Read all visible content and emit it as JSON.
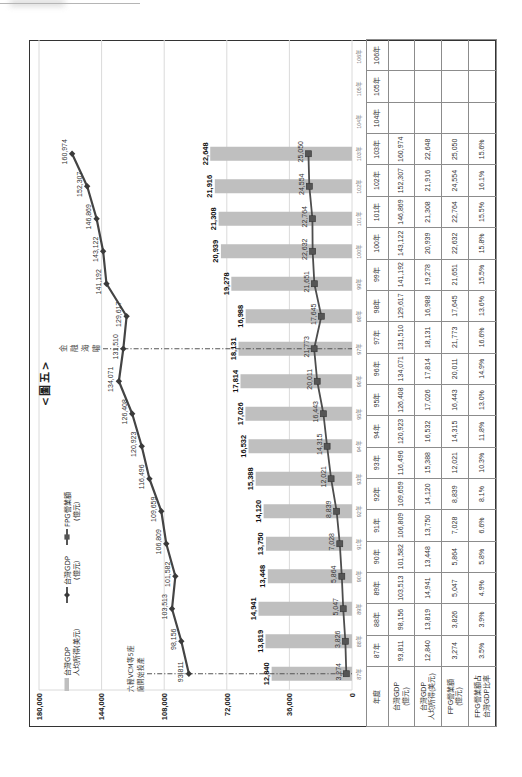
{
  "chart_data": {
    "type": "bar",
    "title": "<圖五>",
    "categories": [
      "87年",
      "88年",
      "89年",
      "90年",
      "91年",
      "92年",
      "93年",
      "94年",
      "95年",
      "96年",
      "97年",
      "98年",
      "99年",
      "100年",
      "101年",
      "102年",
      "103年",
      "104年",
      "105年",
      "106年"
    ],
    "series": [
      {
        "name": "台灣GDP 人均所得(美元)",
        "type": "bar",
        "axis": "secondary",
        "color": "#bfbfbf",
        "values": [
          12840,
          13819,
          14941,
          13448,
          13750,
          14120,
          15388,
          16532,
          17026,
          17814,
          18131,
          16988,
          19278,
          20939,
          21308,
          21916,
          22648,
          null,
          null,
          null
        ]
      },
      {
        "name": "台灣GDP (億元)",
        "type": "line",
        "marker": "diamond",
        "axis": "primary",
        "color": "#444444",
        "values": [
          93811,
          98156,
          103513,
          101582,
          106809,
          109659,
          116496,
          120923,
          126408,
          134071,
          131510,
          129617,
          141192,
          143122,
          146869,
          152307,
          160974,
          null,
          null,
          null
        ]
      },
      {
        "name": "FPG營業額 (億元)",
        "type": "line",
        "marker": "square",
        "axis": "primary",
        "color": "#4d4d4d",
        "values": [
          3274,
          3826,
          5047,
          5864,
          7028,
          8839,
          12021,
          14315,
          16443,
          20011,
          21773,
          17645,
          21651,
          22632,
          22764,
          24554,
          25050,
          null,
          null,
          null
        ]
      }
    ],
    "xlabel": "",
    "ylabel": "",
    "ylim": [
      0,
      180000
    ],
    "yticks": [
      0,
      36000,
      72000,
      108000,
      144000,
      180000
    ],
    "ytick_labels": [
      "0",
      "36,000",
      "72,000",
      "108,000",
      "144,000",
      "180,000"
    ],
    "y2lim": [
      0,
      50000
    ],
    "grid": true,
    "gridline_color": "#dadada",
    "legend_position": "top-left inside plot",
    "legend": [
      {
        "symbol": "bar",
        "lines": [
          "台灣GDP",
          "人均所得(美元)"
        ]
      },
      {
        "symbol": "line-diamond",
        "lines": [
          "台灣GDP",
          "(億元)"
        ]
      },
      {
        "symbol": "line-square",
        "lines": [
          "FPG營業額",
          "(億元)"
        ]
      }
    ],
    "annotations": [
      {
        "at": "87年",
        "lines": [
          "六輕VCM等5座",
          "廠開始投產"
        ]
      },
      {
        "at": "97年",
        "orientation": "vertical",
        "lines": [
          "金",
          "融",
          "海",
          "嘯"
        ]
      }
    ]
  },
  "table": {
    "header_label": "年度",
    "row_headers": [
      [
        "台灣GDP",
        "(億元)"
      ],
      [
        "台灣GDP",
        "人均所得(美元)"
      ],
      [
        "FPG營業額",
        "(億元)"
      ],
      [
        "FPG營業額占",
        "台灣GDP比率"
      ]
    ],
    "columns": [
      {
        "year": "87年",
        "gdp": "93,811",
        "per_capita_usd": "12,840",
        "fpg_revenue": "3,274",
        "fpg_share": "3.5%"
      },
      {
        "year": "88年",
        "gdp": "98,156",
        "per_capita_usd": "13,819",
        "fpg_revenue": "3,826",
        "fpg_share": "3.9%"
      },
      {
        "year": "89年",
        "gdp": "103,513",
        "per_capita_usd": "14,941",
        "fpg_revenue": "5,047",
        "fpg_share": "4.9%"
      },
      {
        "year": "90年",
        "gdp": "101,582",
        "per_capita_usd": "13,448",
        "fpg_revenue": "5,864",
        "fpg_share": "5.8%"
      },
      {
        "year": "91年",
        "gdp": "106,809",
        "per_capita_usd": "13,750",
        "fpg_revenue": "7,028",
        "fpg_share": "6.6%"
      },
      {
        "year": "92年",
        "gdp": "109,659",
        "per_capita_usd": "14,120",
        "fpg_revenue": "8,839",
        "fpg_share": "8.1%"
      },
      {
        "year": "93年",
        "gdp": "116,496",
        "per_capita_usd": "15,388",
        "fpg_revenue": "12,021",
        "fpg_share": "10.3%"
      },
      {
        "year": "94年",
        "gdp": "120,923",
        "per_capita_usd": "16,532",
        "fpg_revenue": "14,315",
        "fpg_share": "11.8%"
      },
      {
        "year": "95年",
        "gdp": "126,408",
        "per_capita_usd": "17,026",
        "fpg_revenue": "16,443",
        "fpg_share": "13.0%"
      },
      {
        "year": "96年",
        "gdp": "134,071",
        "per_capita_usd": "17,814",
        "fpg_revenue": "20,011",
        "fpg_share": "14.9%"
      },
      {
        "year": "97年",
        "gdp": "131,510",
        "per_capita_usd": "18,131",
        "fpg_revenue": "21,773",
        "fpg_share": "16.6%"
      },
      {
        "year": "98年",
        "gdp": "129,617",
        "per_capita_usd": "16,988",
        "fpg_revenue": "17,645",
        "fpg_share": "13.6%"
      },
      {
        "year": "99年",
        "gdp": "141,192",
        "per_capita_usd": "19,278",
        "fpg_revenue": "21,651",
        "fpg_share": "15.5%"
      },
      {
        "year": "100年",
        "gdp": "143,122",
        "per_capita_usd": "20,939",
        "fpg_revenue": "22,632",
        "fpg_share": "15.8%"
      },
      {
        "year": "101年",
        "gdp": "146,869",
        "per_capita_usd": "21,308",
        "fpg_revenue": "22,764",
        "fpg_share": "15.5%"
      },
      {
        "year": "102年",
        "gdp": "152,307",
        "per_capita_usd": "21,916",
        "fpg_revenue": "24,554",
        "fpg_share": "16.1%"
      },
      {
        "year": "103年",
        "gdp": "160,974",
        "per_capita_usd": "22,648",
        "fpg_revenue": "25,050",
        "fpg_share": "15.6%"
      },
      {
        "year": "104年",
        "gdp": "",
        "per_capita_usd": "",
        "fpg_revenue": "",
        "fpg_share": ""
      },
      {
        "year": "105年",
        "gdp": "",
        "per_capita_usd": "",
        "fpg_revenue": "",
        "fpg_share": ""
      },
      {
        "year": "106年",
        "gdp": "",
        "per_capita_usd": "",
        "fpg_revenue": "",
        "fpg_share": ""
      }
    ]
  }
}
